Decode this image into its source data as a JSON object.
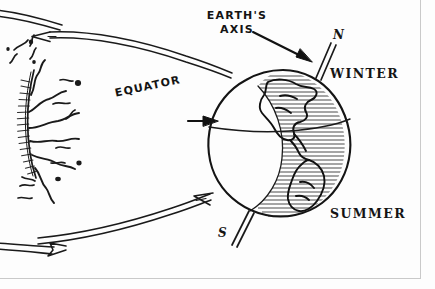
{
  "figure": {
    "style": "hand-drawn ink sketch",
    "background_color": "#fdfdfd",
    "ink_color": "#141414",
    "frame_color": "#c9c9c9"
  },
  "labels": {
    "earths_axis_line1": "EARTH'S",
    "earths_axis_line2": "AXIS",
    "equator": "EQUATOR",
    "winter": "WINTER",
    "summer": "SUMMER",
    "north_pole": "N",
    "south_pole": "S"
  },
  "objects": {
    "sun": {
      "name": "sun",
      "position": "left edge, partially cropped",
      "features": "radial corona hatching with solar prominence squiggles"
    },
    "earth": {
      "name": "earth-globe",
      "position": "right of center",
      "features": "tilted axis through N and S poles, curved equator line, hatched night/land hemisphere showing the Americas"
    },
    "axis": {
      "name": "earth-axis-line",
      "tilt_description": "tilted double line from N (upper right) to S (lower left)"
    },
    "radiation_arrows": [
      {
        "name": "arrow-top-toward-sun",
        "direction": "left"
      },
      {
        "name": "arrow-bottom-away-from-sun",
        "direction": "right"
      },
      {
        "name": "arrow-bottom-left",
        "direction": "right"
      }
    ],
    "pointer_arrows": [
      {
        "name": "arrow-pointer-axis",
        "points_to": "earth-axis-line"
      },
      {
        "name": "arrow-pointer-equator",
        "points_to": "equator-line"
      }
    ]
  }
}
